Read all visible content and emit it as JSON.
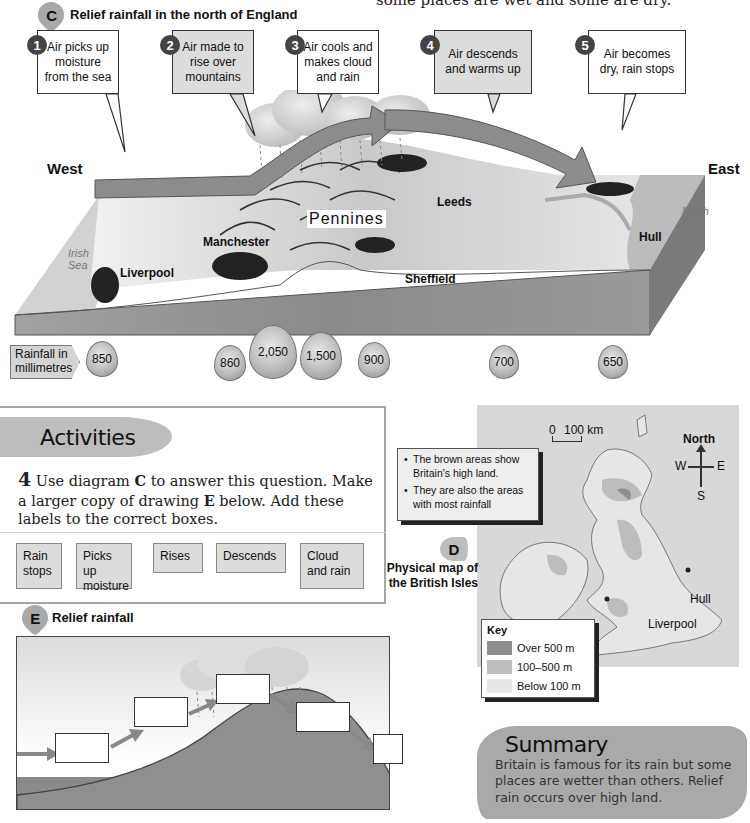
{
  "intro_text": "some places are wet and some are dry.",
  "figure_c": {
    "tag": "C",
    "title": "Relief rainfall in the north of England",
    "callouts": [
      {
        "num": "1",
        "text": "Air picks up moisture from the sea",
        "shaded": false
      },
      {
        "num": "2",
        "text": "Air made to rise over mountains",
        "shaded": true
      },
      {
        "num": "3",
        "text": "Air cools and makes cloud and rain",
        "shaded": false
      },
      {
        "num": "4",
        "text": "Air descends and warms up",
        "shaded": true
      },
      {
        "num": "5",
        "text": "Air becomes dry, rain stops",
        "shaded": false
      }
    ],
    "west_label": "West",
    "east_label": "East",
    "places": {
      "irish_sea": "Irish Sea",
      "north_sea": "North Sea",
      "liverpool": "Liverpool",
      "manchester": "Manchester",
      "pennines": "Pennines",
      "leeds": "Leeds",
      "sheffield": "Sheffield",
      "hull": "Hull"
    },
    "rainfall_label": "Rainfall in millimetres",
    "rainfall_values": [
      "850",
      "860",
      "2,050",
      "1,500",
      "900",
      "700",
      "650"
    ]
  },
  "activities": {
    "heading": "Activities",
    "question_number": "4",
    "question_parts": {
      "a": "Use diagram ",
      "b": "C",
      "c": " to answer this question. Make a larger copy of drawing ",
      "d": "E",
      "e": " below. Add these labels to the correct boxes."
    },
    "labels": [
      "Rain stops",
      "Picks up moisture",
      "Rises",
      "Descends",
      "Cloud and rain"
    ]
  },
  "figure_e": {
    "tag": "E",
    "title": "Relief rainfall"
  },
  "figure_d": {
    "tag": "D",
    "caption": "Physical map of the British Isles",
    "notes": [
      "The brown areas show Britain's high land.",
      "They are also the areas with most rainfall"
    ],
    "scale": {
      "zero": "0",
      "distance": "100 km"
    },
    "compass": {
      "north": "North",
      "west": "W",
      "east": "E",
      "south": "S"
    },
    "cities": {
      "hull": "Hull",
      "liverpool": "Liverpool"
    },
    "key": {
      "title": "Key",
      "items": [
        {
          "label": "Over 500 m",
          "color": "#8e8e8e"
        },
        {
          "label": "100–500 m",
          "color": "#bdbdbd"
        },
        {
          "label": "Below 100 m",
          "color": "#e6e6e6"
        }
      ]
    }
  },
  "summary": {
    "title": "Summary",
    "body": "Britain is famous for its rain but some places are wetter than others. Relief rain occurs over high land."
  }
}
